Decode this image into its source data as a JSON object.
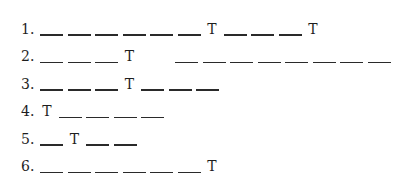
{
  "puzzle": {
    "rows": [
      {
        "number": "1.",
        "slots": [
          "_",
          "_",
          "_",
          "_",
          "_",
          "_",
          "T",
          "_",
          "_",
          "_",
          "T"
        ]
      },
      {
        "number": "2.",
        "slots": [
          "_",
          "_",
          "_",
          "T",
          "GAP",
          "_",
          "_",
          "_",
          "_",
          "_",
          "_",
          "_",
          "_"
        ]
      },
      {
        "number": "3.",
        "slots": [
          "_",
          "_",
          "_",
          "T",
          "_",
          "_",
          "_"
        ]
      },
      {
        "number": "4.",
        "slots": [
          "T",
          "_",
          "_",
          "_",
          "_"
        ]
      },
      {
        "number": "5.",
        "slots": [
          "_",
          "T",
          "_",
          "_"
        ]
      },
      {
        "number": "6.",
        "slots": [
          "_",
          "_",
          "_",
          "_",
          "_",
          "_",
          "T"
        ]
      }
    ],
    "gap_width_px": 34
  }
}
